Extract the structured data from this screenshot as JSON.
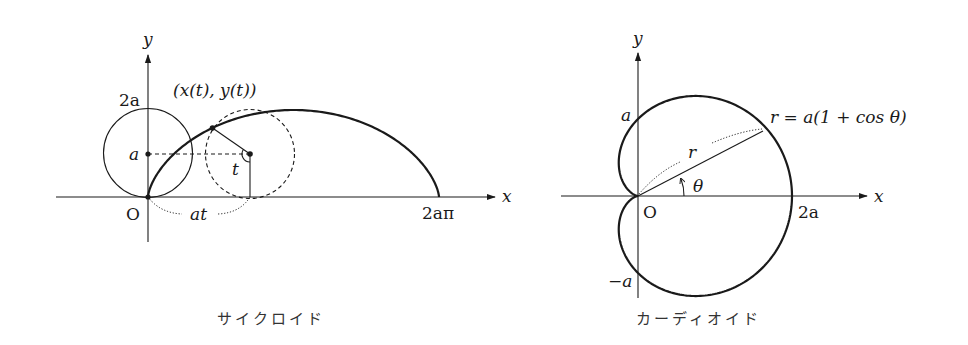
{
  "figures": [
    {
      "id": "cycloid",
      "caption": "サイクロイド",
      "axes": {
        "x_label": "x",
        "y_label": "y",
        "origin_label": "O"
      },
      "labels": {
        "two_a": "2a",
        "a": "a",
        "point": "(x(t), y(t))",
        "angle": "t",
        "arc_length": "at",
        "end": "2aπ"
      },
      "curve": "x = a(t − sin t), y = a(1 − cos t), 0 ≤ t ≤ 2π"
    },
    {
      "id": "cardioid",
      "caption": "カーディオイド",
      "axes": {
        "x_label": "x",
        "y_label": "y",
        "origin_label": "O"
      },
      "labels": {
        "a": "a",
        "neg_a": "−a",
        "two_a": "2a",
        "equation": "r = a(1 + cos θ)",
        "radius": "r",
        "angle": "θ"
      },
      "curve": "r = a(1 + cos θ)"
    }
  ],
  "colors": {
    "ink": "#1a1a1a",
    "background": "#ffffff"
  }
}
